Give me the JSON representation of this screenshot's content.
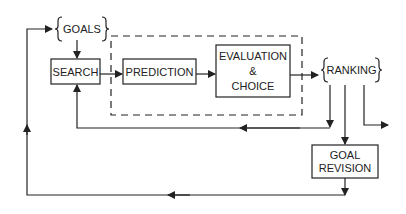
{
  "diagram": {
    "goals": "GOALS",
    "search": "SEARCH",
    "prediction": "PREDICTION",
    "evaluation": [
      "EVALUATION",
      "&",
      "CHOICE"
    ],
    "ranking": "RANKING",
    "goal_revision": [
      "GOAL",
      "REVISION"
    ]
  },
  "colors": {
    "stroke": "#222222",
    "background": "#ffffff"
  }
}
